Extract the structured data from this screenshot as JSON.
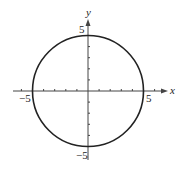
{
  "figure": {
    "type": "circle-graph",
    "equation_depicted": "x^2 + y^2 = 25",
    "center": [
      0,
      0
    ],
    "radius": 5
  },
  "axes": {
    "x_label": "x",
    "y_label": "y",
    "x_range": [
      -6,
      6
    ],
    "y_range": [
      -5,
      5
    ],
    "tick_step": 1
  },
  "labels": {
    "x_neg": "−5",
    "x_pos": "5",
    "y_pos": "5",
    "y_neg": "−5"
  },
  "colors": {
    "curve": "#222222",
    "axis": "#444444",
    "background": "#ffffff"
  }
}
